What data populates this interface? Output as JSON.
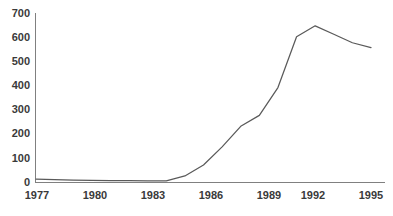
{
  "chart_data": {
    "type": "line",
    "title": "",
    "subtitle": "",
    "xlabel": "",
    "ylabel": "",
    "x": [
      1977,
      1978,
      1979,
      1980,
      1981,
      1982,
      1983,
      1984,
      1985,
      1986,
      1987,
      1988,
      1989,
      1990,
      1991,
      1992,
      1993,
      1994,
      1995
    ],
    "values": [
      12,
      10,
      8,
      7,
      6,
      6,
      5,
      5,
      25,
      70,
      145,
      230,
      275,
      390,
      600,
      645,
      610,
      575,
      555
    ],
    "series": [
      {
        "name": "",
        "values": [
          12,
          10,
          8,
          7,
          6,
          6,
          5,
          5,
          25,
          70,
          145,
          230,
          275,
          390,
          600,
          645,
          610,
          575,
          555
        ]
      }
    ],
    "xlim": [
      1977,
      1995
    ],
    "ylim": [
      0,
      700
    ],
    "xticks": [
      1977,
      1980,
      1983,
      1986,
      1989,
      1992,
      1995
    ],
    "yticks": [
      0,
      100,
      200,
      300,
      400,
      500,
      600,
      700
    ],
    "xtick_labels": [
      "1977",
      "1980",
      "1983",
      "1986",
      "1989",
      "1992",
      "1995"
    ],
    "ytick_labels": [
      "0",
      "100",
      "200",
      "300",
      "400",
      "500",
      "600",
      "700"
    ],
    "grid": false,
    "legend": false,
    "legend_position": "none",
    "line_color": "#5a5a5a",
    "axis_color": "#808080",
    "text_color": "#3a3a3a",
    "background_color": "#ffffff",
    "annotations": []
  },
  "figure": {
    "caption_fragment": ""
  }
}
